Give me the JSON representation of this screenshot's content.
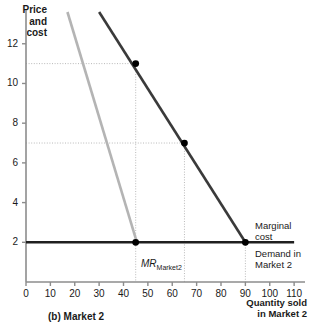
{
  "figure": {
    "panel_label": "(b) Market 2",
    "y_axis_title_lines": [
      "Price",
      "and",
      "cost"
    ],
    "x_axis_title_lines": [
      "Quantity sold",
      "in Market 2"
    ]
  },
  "annotations": {
    "marginal_cost_lines": [
      "Marginal",
      "cost"
    ],
    "demand_lines": [
      "Demand in",
      "Market 2"
    ],
    "mr_label_main": "MR",
    "mr_label_sub": "Market2"
  },
  "chart_data": {
    "type": "line",
    "title": "(b) Market 2",
    "xlabel": "Quantity sold in Market 2",
    "ylabel": "Price and cost",
    "xlim": [
      0,
      112
    ],
    "ylim": [
      0,
      13.6
    ],
    "xticks": [
      0,
      10,
      20,
      30,
      40,
      50,
      60,
      70,
      80,
      90,
      100,
      110
    ],
    "yticks": [
      2,
      4,
      6,
      8,
      10,
      12
    ],
    "grid": false,
    "legend": "none",
    "series": [
      {
        "name": "Demand in Market 2",
        "color": "#3a3a3a",
        "width": 2.6,
        "points": [
          [
            30,
            13.6
          ],
          [
            90,
            2.0
          ]
        ]
      },
      {
        "name": "MR Market2",
        "color": "#b4b4b4",
        "width": 2.6,
        "points": [
          [
            17,
            13.6
          ],
          [
            45.5,
            2.0
          ]
        ]
      },
      {
        "name": "Marginal cost",
        "color": "#1f1f1f",
        "width": 2.6,
        "points": [
          [
            0,
            2.0
          ],
          [
            110,
            2.0
          ]
        ]
      }
    ],
    "markers": [
      {
        "x": 45,
        "y": 11,
        "label": "price-quantity point on demand"
      },
      {
        "x": 65,
        "y": 7,
        "label": "midpoint on demand"
      },
      {
        "x": 45,
        "y": 2,
        "label": "MR equals MC"
      },
      {
        "x": 90,
        "y": 2,
        "label": "demand meets marginal cost"
      }
    ],
    "guides": [
      {
        "type": "h",
        "value": 11,
        "from_x": 0,
        "to_x": 45
      },
      {
        "type": "h",
        "value": 7,
        "from_x": 0,
        "to_x": 65
      },
      {
        "type": "v",
        "value": 45,
        "from_y": 0,
        "to_y": 11
      },
      {
        "type": "v",
        "value": 65,
        "from_y": 0,
        "to_y": 7
      },
      {
        "type": "v",
        "value": 90,
        "from_y": 0,
        "to_y": 2
      }
    ]
  }
}
